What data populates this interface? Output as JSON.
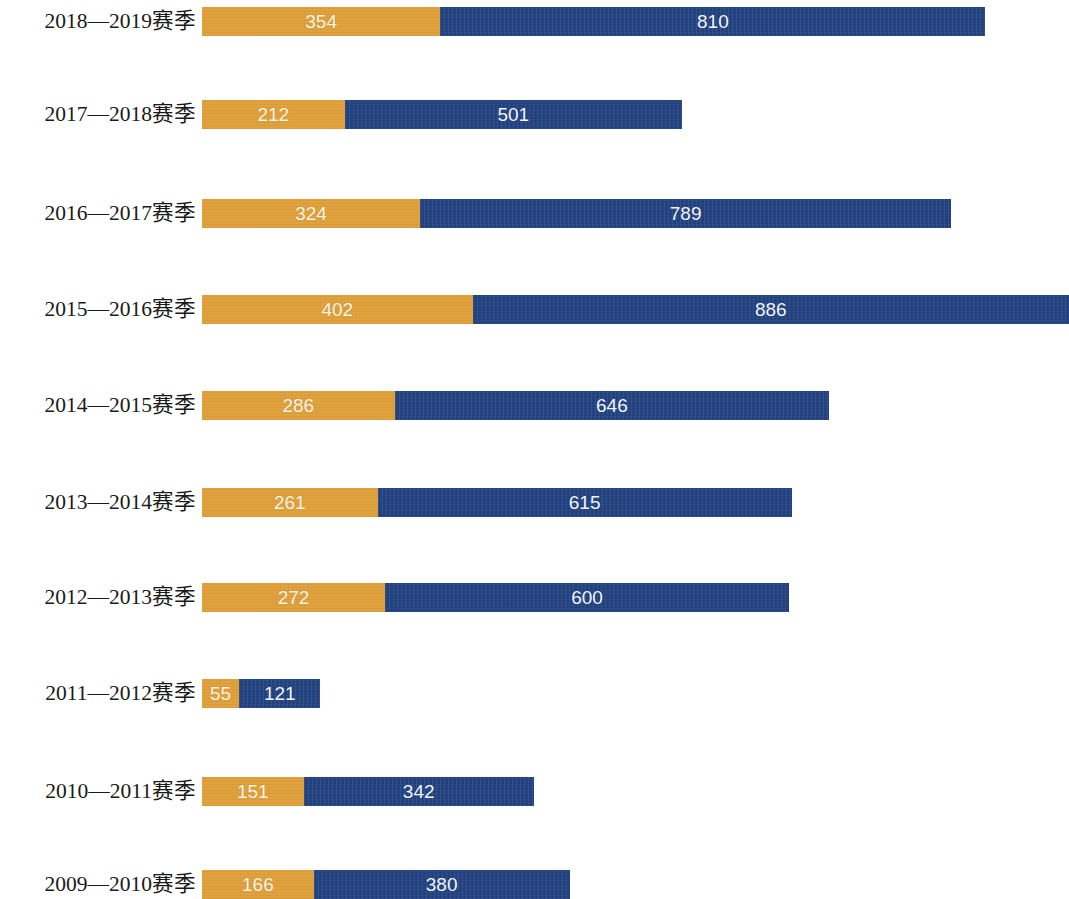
{
  "chart_data": {
    "type": "bar",
    "subtype": "stacked-horizontal",
    "title": "",
    "subtitle": "",
    "xlabel": "",
    "ylabel": "",
    "grid": false,
    "legend": null,
    "axis_visible": false,
    "xlim": [
      0,
      1288
    ],
    "colors": {
      "series_1": "#e0a03a",
      "series_2": "#20407e",
      "value_label": "#ffffff",
      "category_label": "#1a1a1a",
      "background": "#ffffff"
    },
    "categories": [
      "2018—2019赛季",
      "2017—2018赛季",
      "2016—2017赛季",
      "2015—2016赛季",
      "2014—2015赛季",
      "2013—2014赛季",
      "2012—2013赛季",
      "2011—2012赛季",
      "2010—2011赛季",
      "2009—2010赛季"
    ],
    "series": [
      {
        "name": "series_1",
        "color": "#e0a03a",
        "values": [
          354,
          212,
          324,
          402,
          286,
          261,
          272,
          55,
          151,
          166
        ]
      },
      {
        "name": "series_2",
        "color": "#20407e",
        "values": [
          810,
          501,
          789,
          886,
          646,
          615,
          600,
          121,
          342,
          380
        ]
      }
    ],
    "totals": [
      1164,
      713,
      1113,
      1288,
      932,
      876,
      872,
      176,
      493,
      546
    ]
  },
  "rows": [
    {
      "label": "2018—2019赛季",
      "a": 354,
      "b": 810,
      "a_text": "354",
      "b_text": "810",
      "top": 7
    },
    {
      "label": "2017—2018赛季",
      "a": 212,
      "b": 501,
      "a_text": "212",
      "b_text": "501",
      "top": 100
    },
    {
      "label": "2016—2017赛季",
      "a": 324,
      "b": 789,
      "a_text": "324",
      "b_text": "789",
      "top": 199
    },
    {
      "label": "2015—2016赛季",
      "a": 402,
      "b": 886,
      "a_text": "402",
      "b_text": "886",
      "top": 295
    },
    {
      "label": "2014—2015赛季",
      "a": 286,
      "b": 646,
      "a_text": "286",
      "b_text": "646",
      "top": 391
    },
    {
      "label": "2013—2014赛季",
      "a": 261,
      "b": 615,
      "a_text": "261",
      "b_text": "615",
      "top": 488
    },
    {
      "label": "2012—2013赛季",
      "a": 272,
      "b": 600,
      "a_text": "272",
      "b_text": "600",
      "top": 583
    },
    {
      "label": "2011—2012赛季",
      "a": 55,
      "b": 121,
      "a_text": "55",
      "b_text": "121",
      "top": 679
    },
    {
      "label": "2010—2011赛季",
      "a": 151,
      "b": 342,
      "a_text": "151",
      "b_text": "342",
      "top": 777
    },
    {
      "label": "2009—2010赛季",
      "a": 166,
      "b": 380,
      "a_text": "166",
      "b_text": "380",
      "top": 870
    }
  ],
  "scale_px_per_unit": 0.6731
}
